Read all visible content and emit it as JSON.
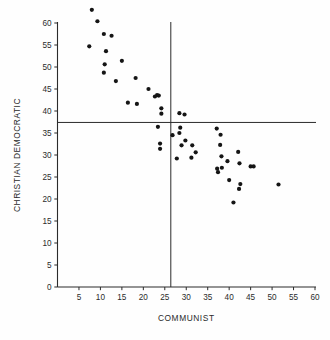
{
  "chart_data": {
    "type": "scatter",
    "title": "",
    "xlabel": "COMMUNIST",
    "ylabel": "CHRISTIAN DEMOCRATIC",
    "xlim": [
      0,
      60
    ],
    "ylim": [
      0,
      64
    ],
    "grid": false,
    "legend": null,
    "xticks": [
      5,
      10,
      15,
      20,
      25,
      30,
      35,
      40,
      45,
      50,
      55,
      60
    ],
    "yticks": [
      0,
      5,
      10,
      15,
      20,
      25,
      30,
      35,
      40,
      45,
      50,
      55,
      60
    ],
    "x_axis_origin_label": "0",
    "reference_lines": [
      {
        "name": "horizontal-mean-line",
        "orientation": "horizontal",
        "value": 37.4
      },
      {
        "name": "vertical-mean-line",
        "orientation": "vertical",
        "value": 26.4
      }
    ],
    "marker": {
      "shape": "circle",
      "color": "#151515",
      "size": 2.1
    },
    "points": [
      {
        "x": 8.0,
        "y": 63.0
      },
      {
        "x": 9.3,
        "y": 60.4
      },
      {
        "x": 10.8,
        "y": 57.5
      },
      {
        "x": 12.6,
        "y": 57.1
      },
      {
        "x": 7.4,
        "y": 54.7
      },
      {
        "x": 11.3,
        "y": 53.6
      },
      {
        "x": 15.0,
        "y": 51.4
      },
      {
        "x": 11.0,
        "y": 50.6
      },
      {
        "x": 10.8,
        "y": 48.7
      },
      {
        "x": 18.2,
        "y": 47.5
      },
      {
        "x": 13.6,
        "y": 46.8
      },
      {
        "x": 21.2,
        "y": 45.0
      },
      {
        "x": 23.2,
        "y": 43.6
      },
      {
        "x": 23.6,
        "y": 43.5
      },
      {
        "x": 22.7,
        "y": 43.3
      },
      {
        "x": 16.4,
        "y": 41.9
      },
      {
        "x": 18.5,
        "y": 41.6
      },
      {
        "x": 24.2,
        "y": 40.6
      },
      {
        "x": 24.2,
        "y": 39.4
      },
      {
        "x": 28.4,
        "y": 39.5
      },
      {
        "x": 29.6,
        "y": 39.2
      },
      {
        "x": 23.4,
        "y": 36.4
      },
      {
        "x": 28.6,
        "y": 36.2
      },
      {
        "x": 37.1,
        "y": 36.0
      },
      {
        "x": 28.4,
        "y": 35.0
      },
      {
        "x": 26.8,
        "y": 34.5
      },
      {
        "x": 38.0,
        "y": 34.6
      },
      {
        "x": 29.8,
        "y": 33.3
      },
      {
        "x": 23.9,
        "y": 32.6
      },
      {
        "x": 28.9,
        "y": 32.2
      },
      {
        "x": 31.4,
        "y": 32.2
      },
      {
        "x": 37.9,
        "y": 32.3
      },
      {
        "x": 23.9,
        "y": 31.4
      },
      {
        "x": 32.2,
        "y": 30.6
      },
      {
        "x": 42.1,
        "y": 30.7
      },
      {
        "x": 38.2,
        "y": 29.7
      },
      {
        "x": 31.2,
        "y": 29.4
      },
      {
        "x": 27.8,
        "y": 29.2
      },
      {
        "x": 39.6,
        "y": 28.6
      },
      {
        "x": 42.4,
        "y": 28.1
      },
      {
        "x": 45.0,
        "y": 27.4
      },
      {
        "x": 45.7,
        "y": 27.4
      },
      {
        "x": 38.3,
        "y": 27.1
      },
      {
        "x": 37.2,
        "y": 26.9
      },
      {
        "x": 37.4,
        "y": 26.1
      },
      {
        "x": 40.0,
        "y": 24.3
      },
      {
        "x": 42.6,
        "y": 23.4
      },
      {
        "x": 51.5,
        "y": 23.3
      },
      {
        "x": 42.3,
        "y": 22.3
      },
      {
        "x": 41.0,
        "y": 19.2
      }
    ]
  }
}
